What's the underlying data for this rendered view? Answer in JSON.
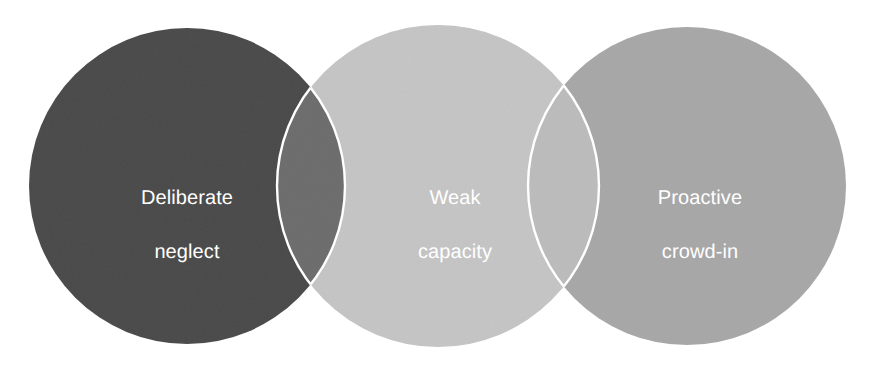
{
  "diagram": {
    "type": "venn",
    "background_color": "#ffffff",
    "outline_color": "#ffffff",
    "outline_width": 2.4,
    "label_color": "#ffffff",
    "label_font_size": 20,
    "canvas": {
      "width": 872,
      "height": 368
    },
    "circles": [
      {
        "id": "circle-deliberate-neglect",
        "label_line1": "Deliberate",
        "label_line2": "neglect",
        "fill_color": "#4d4d4d",
        "cx": 187,
        "cy": 186,
        "r": 158,
        "label_x": 187,
        "label_y": 186
      },
      {
        "id": "circle-weak-capacity",
        "label_line1": "Weak",
        "label_line2": "capacity",
        "fill_color": "#c6c6c6",
        "cx": 438,
        "cy": 186,
        "r": 161,
        "label_x": 455,
        "label_y": 186
      },
      {
        "id": "circle-proactive-crowd-in",
        "label_line1": "Proactive",
        "label_line2": "crowd-in",
        "fill_color": "#a9a9a9",
        "cx": 687,
        "cy": 186,
        "r": 159,
        "label_x": 700,
        "label_y": 186
      }
    ],
    "overlaps": [
      {
        "id": "overlap-neglect-capacity",
        "between": [
          "circle-deliberate-neglect",
          "circle-weak-capacity"
        ],
        "fill_color": "#6f6f6f"
      },
      {
        "id": "overlap-capacity-crowd-in",
        "between": [
          "circle-weak-capacity",
          "circle-proactive-crowd-in"
        ],
        "fill_color": "#bdbdbd"
      }
    ]
  }
}
